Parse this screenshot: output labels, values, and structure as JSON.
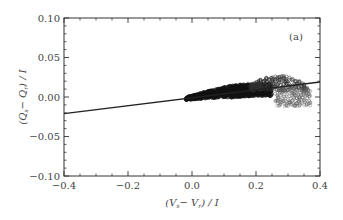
{
  "chart_data": {
    "type": "scatter",
    "title": "",
    "panel_label": "(a)",
    "xlabel": "(V_s − V_r) / I",
    "ylabel": "(Q_s − Q_r) / I",
    "xlim": [
      -0.4,
      0.4
    ],
    "ylim": [
      -0.1,
      0.1
    ],
    "xticks": [
      -0.4,
      -0.2,
      0.0,
      0.2,
      0.4
    ],
    "xtick_labels": [
      "−0.4",
      "−0.2",
      "0.0",
      "0.2",
      "0.4"
    ],
    "yticks": [
      -0.1,
      -0.05,
      0.0,
      0.05,
      0.1
    ],
    "ytick_labels": [
      "−0.10",
      "−0.05",
      "0.00",
      "0.05",
      "0.10"
    ],
    "x_minor_step": 0.05,
    "y_minor_step": 0.01,
    "grid": false,
    "legend": null,
    "series": [
      {
        "name": "fit line",
        "kind": "line",
        "x": [
          -0.4,
          0.4
        ],
        "y": [
          -0.021,
          0.019
        ],
        "slope": 0.05,
        "color": "#222222"
      },
      {
        "name": "data (dense band)",
        "kind": "scatter",
        "marker": "open-circle",
        "approx_region": {
          "x": [
            -0.02,
            0.25
          ],
          "y": [
            -0.012,
            0.012
          ]
        },
        "centerline": [
          [
            -0.02,
            -0.002
          ],
          [
            0.05,
            0.003
          ],
          [
            0.1,
            0.006
          ],
          [
            0.15,
            0.008
          ],
          [
            0.2,
            0.009
          ],
          [
            0.25,
            0.009
          ]
        ],
        "color": "#111111"
      },
      {
        "name": "data (sparse upper lobe)",
        "kind": "scatter",
        "marker": "open-circle",
        "approx_region": {
          "x": [
            0.18,
            0.36
          ],
          "y": [
            0.008,
            0.027
          ]
        },
        "color": "#333333"
      },
      {
        "name": "data (sparse lower lobe)",
        "kind": "scatter",
        "marker": "open-circle",
        "approx_region": {
          "x": [
            0.26,
            0.37
          ],
          "y": [
            -0.012,
            0.012
          ]
        },
        "color": "#555555"
      }
    ]
  }
}
